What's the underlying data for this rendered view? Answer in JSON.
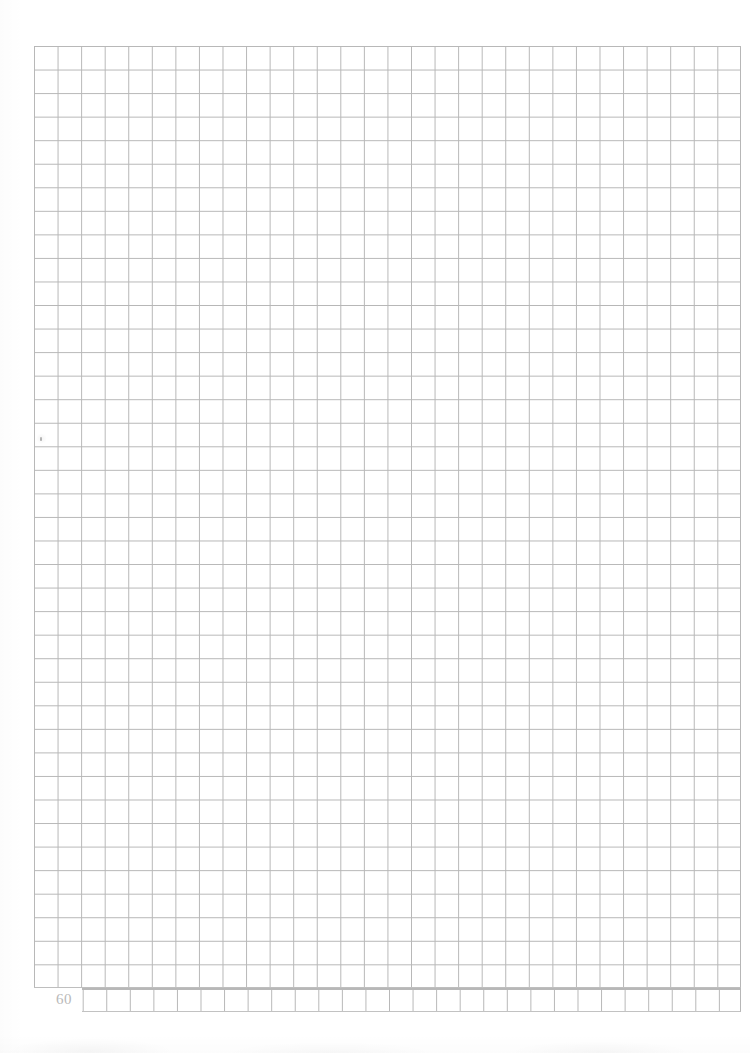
{
  "document": {
    "type": "graph-paper-page",
    "page_number": "60",
    "background_color": "#ffffff",
    "grid_line_color": "#b4b4b4"
  },
  "grid": {
    "columns": 30,
    "rows": 41,
    "cell_width_px": 23.57,
    "cell_height_px": 23.55,
    "left_px": 34,
    "top_px": 46,
    "right_px": 741,
    "bottom_px": 1012,
    "bottom_strip_left_px": 82,
    "description": "Blank square-ruled graph paper grid"
  },
  "marks": {
    "stray_pencil_dot": {
      "label": "stray pencil dot",
      "x_px": 41,
      "y_px": 439
    }
  },
  "artifacts": {
    "bottom_smudge": "faint scanner shadow along lower edge",
    "left_edge_shadow": "faint scanner shadow along left edge"
  }
}
